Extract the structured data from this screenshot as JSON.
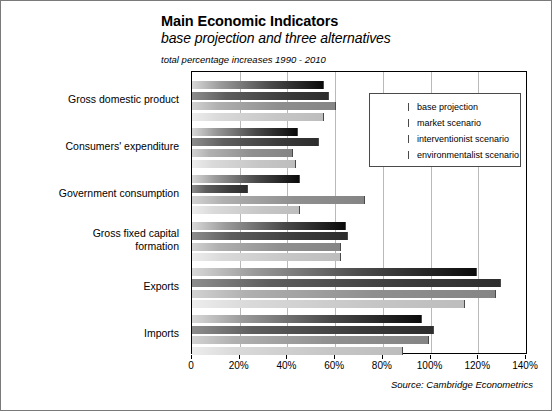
{
  "chart_data": {
    "type": "bar",
    "orientation": "horizontal",
    "title": "Main Economic Indicators",
    "subtitle": "base projection and three alternatives",
    "note": "total percentage increases 1990 - 2010",
    "xlabel": "",
    "ylabel": "",
    "xlim": [
      0,
      140
    ],
    "xtick_values": [
      0,
      20,
      40,
      60,
      80,
      100,
      120,
      140
    ],
    "xtick_labels": [
      "0",
      "20%",
      "40%",
      "60%",
      "80%",
      "100%",
      "120%",
      "140%"
    ],
    "grid": "vertical",
    "legend_position": "top-right-inside",
    "categories": [
      "Gross domestic product",
      "Consumers' expenditure",
      "Government consumption",
      "Gross fixed capital formation",
      "Exports",
      "Imports"
    ],
    "series": [
      {
        "name": "base projection",
        "color": "#111111",
        "values": [
          55,
          44,
          45,
          64,
          119,
          96
        ]
      },
      {
        "name": "market scenario",
        "color": "#3b3b3b",
        "values": [
          57,
          53,
          23,
          65,
          129,
          101
        ]
      },
      {
        "name": "interventionist scenario",
        "color": "#8f8f8f",
        "values": [
          60,
          42,
          72,
          62,
          127,
          99
        ]
      },
      {
        "name": "environmentalist scenario",
        "color": "#c6c6c6",
        "values": [
          55,
          43,
          45,
          62,
          114,
          88
        ]
      }
    ],
    "source": "Source: Cambridge Econometrics"
  },
  "legend": {
    "items": [
      {
        "label": "base projection"
      },
      {
        "label": "market scenario"
      },
      {
        "label": "interventionist scenario"
      },
      {
        "label": "environmentalist scenario"
      }
    ]
  }
}
